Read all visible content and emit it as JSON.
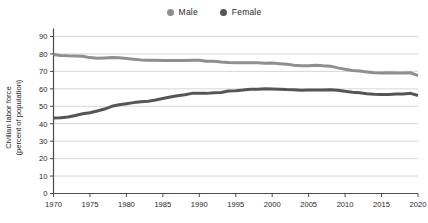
{
  "legend": {
    "items": [
      {
        "label": "Male",
        "color": "#8f8f8f",
        "dot_name": "legend-dot-male"
      },
      {
        "label": "Female",
        "color": "#555555",
        "dot_name": "legend-dot-female"
      }
    ]
  },
  "axis": {
    "ylabel_line1": "Civilian labor force",
    "ylabel_line2": "(percent of population)",
    "yticks": [
      "90",
      "80",
      "70",
      "60",
      "50",
      "40",
      "30",
      "20",
      "10",
      "0"
    ],
    "xticks": [
      "1970",
      "1975",
      "1980",
      "1985",
      "1990",
      "1995",
      "2000",
      "2005",
      "2010",
      "2015",
      "2020"
    ]
  },
  "colors": {
    "male_line": "#8f8f8f",
    "female_line": "#555555",
    "gridline": "#d7d7d7",
    "axis": "#4a4a4a",
    "background": "#ffffff"
  },
  "chart_data": {
    "type": "line",
    "title": "",
    "xlabel": "",
    "ylabel": "Civilian labor force (percent of population)",
    "xlim": [
      1970,
      2020
    ],
    "ylim": [
      0,
      90
    ],
    "grid": true,
    "legend_position": "top-center",
    "x": [
      1970,
      1971,
      1972,
      1973,
      1974,
      1975,
      1976,
      1977,
      1978,
      1979,
      1980,
      1981,
      1982,
      1983,
      1984,
      1985,
      1986,
      1987,
      1988,
      1989,
      1990,
      1991,
      1992,
      1993,
      1994,
      1995,
      1996,
      1997,
      1998,
      1999,
      2000,
      2001,
      2002,
      2003,
      2004,
      2005,
      2006,
      2007,
      2008,
      2009,
      2010,
      2011,
      2012,
      2013,
      2014,
      2015,
      2016,
      2017,
      2018,
      2019,
      2020
    ],
    "series": [
      {
        "name": "Male",
        "color": "#8f8f8f",
        "values": [
          79.7,
          79.1,
          78.9,
          78.8,
          78.7,
          77.9,
          77.5,
          77.7,
          77.9,
          77.8,
          77.4,
          77.0,
          76.6,
          76.4,
          76.4,
          76.3,
          76.3,
          76.2,
          76.2,
          76.4,
          76.4,
          75.8,
          75.8,
          75.4,
          75.1,
          75.0,
          74.9,
          75.0,
          74.9,
          74.7,
          74.8,
          74.4,
          74.1,
          73.5,
          73.3,
          73.3,
          73.5,
          73.2,
          73.0,
          72.0,
          71.2,
          70.5,
          70.2,
          69.7,
          69.2,
          69.1,
          69.2,
          69.1,
          69.1,
          69.2,
          67.6
        ]
      },
      {
        "name": "Female",
        "color": "#555555",
        "values": [
          43.3,
          43.4,
          43.9,
          44.7,
          45.7,
          46.3,
          47.3,
          48.4,
          50.0,
          50.9,
          51.5,
          52.1,
          52.6,
          52.9,
          53.6,
          54.5,
          55.3,
          56.0,
          56.6,
          57.4,
          57.5,
          57.4,
          57.8,
          57.9,
          58.8,
          58.9,
          59.3,
          59.8,
          59.8,
          60.0,
          59.9,
          59.8,
          59.6,
          59.5,
          59.2,
          59.3,
          59.4,
          59.3,
          59.5,
          59.2,
          58.6,
          58.1,
          57.7,
          57.2,
          56.9,
          56.7,
          56.8,
          57.0,
          57.1,
          57.4,
          56.2
        ]
      }
    ]
  }
}
